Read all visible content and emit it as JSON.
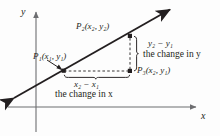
{
  "figure": {
    "background_color": "#fdfdfd",
    "ink_color": "#231f20",
    "axis_color": "#6d6e71"
  },
  "axes": {
    "y_label": "y",
    "x_label": "x",
    "y_axis": {
      "x": 36,
      "y_top": 10,
      "y_bottom": 132
    },
    "x_axis": {
      "y": 107,
      "x_left": 8,
      "x_right": 198
    }
  },
  "line": {
    "name": "slope-line",
    "from": {
      "x": 12,
      "y": 99
    },
    "to": {
      "x": 172,
      "y": 8
    },
    "double_arrow": true
  },
  "points": [
    {
      "id": "P1",
      "label": "P",
      "sub": "1",
      "coords": "(x₁, y₁)",
      "x": 64,
      "y": 71,
      "marked": true
    },
    {
      "id": "P2",
      "label": "P",
      "sub": "2",
      "coords": "(x₂, y₂)",
      "x": 130,
      "y": 36,
      "marked": true
    },
    {
      "id": "P3",
      "label": "P",
      "sub": "3",
      "coords": "(x₂, y₁)",
      "x": 130,
      "y": 71,
      "marked": true
    }
  ],
  "labels": {
    "p1": "P₁(x₁, y₁)",
    "p2": "P₂(x₂, y₂)",
    "p3": "P₃(x₂, y₁)",
    "delta_y": "y₂ − y₁",
    "change_in_y": "the change in y",
    "delta_x": "x₂ − x₁",
    "change_in_x": "the change in x"
  },
  "annotations": {
    "vertical_dashed": {
      "from": {
        "x": 130,
        "y": 36
      },
      "to": {
        "x": 130,
        "y": 71
      }
    },
    "horizontal_dashed": {
      "from": {
        "x": 64,
        "y": 71
      },
      "to": {
        "x": 130,
        "y": 71
      }
    },
    "vertical_brace": {
      "x": 138,
      "y_top": 36,
      "y_bottom": 71,
      "opens": "left"
    },
    "horizontal_brace": {
      "y": 79,
      "x_left": 64,
      "x_right": 130,
      "opens": "up"
    },
    "p1_pointer": {
      "from": {
        "x": 48,
        "y": 60
      },
      "to": {
        "x": 62,
        "y": 69
      }
    }
  }
}
